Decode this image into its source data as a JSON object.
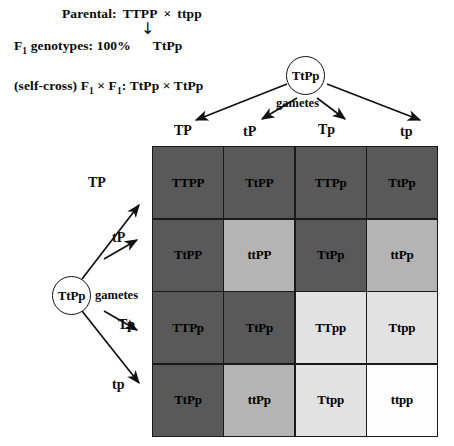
{
  "header": {
    "parental_label": "Parental:",
    "parental_genotype_1": "TTPP",
    "parental_cross_symbol": "×",
    "parental_genotype_2": "ttpp",
    "down_arrow": "↓",
    "f1_label": "F",
    "f1_subscript": "1",
    "f1_label_rest": " genotypes: 100%",
    "f1_genotype": "TtPp",
    "self_cross_prefix": "(self-cross) F",
    "self_cross_sub_1": "1",
    "self_cross_times": " × F",
    "self_cross_sub_2": "1",
    "self_cross_colon": ": TtPp × TtPp"
  },
  "top_parent": {
    "genotype": "TtPp",
    "gametes_word": "gametes",
    "gametes": [
      "TP",
      "tP",
      "Tp",
      "tp"
    ]
  },
  "left_parent": {
    "genotype": "TtPp",
    "gametes_word": "gametes",
    "gametes": [
      "TP",
      "tP",
      "Tp",
      "tp"
    ]
  },
  "punnett": {
    "rows": [
      [
        {
          "genotype": "TTPP",
          "shade": "dark"
        },
        {
          "genotype": "TtPP",
          "shade": "dark"
        },
        {
          "genotype": "TTPp",
          "shade": "dark"
        },
        {
          "genotype": "TtPp",
          "shade": "dark"
        }
      ],
      [
        {
          "genotype": "TtPP",
          "shade": "dark"
        },
        {
          "genotype": "ttPP",
          "shade": "medium"
        },
        {
          "genotype": "TtPp",
          "shade": "dark"
        },
        {
          "genotype": "ttPp",
          "shade": "medium"
        }
      ],
      [
        {
          "genotype": "TTPp",
          "shade": "dark"
        },
        {
          "genotype": "TtPp",
          "shade": "dark"
        },
        {
          "genotype": "TTpp",
          "shade": "light"
        },
        {
          "genotype": "Ttpp",
          "shade": "light"
        }
      ],
      [
        {
          "genotype": "TtPp",
          "shade": "dark"
        },
        {
          "genotype": "ttPp",
          "shade": "medium"
        },
        {
          "genotype": "Ttpp",
          "shade": "light"
        },
        {
          "genotype": "ttpp",
          "shade": "white"
        }
      ]
    ]
  },
  "colors": {
    "dark": "#595959",
    "medium": "#b4b4b4",
    "light": "#e2e2e2",
    "white": "#fdfdfd",
    "line": "#1a1a1a"
  }
}
